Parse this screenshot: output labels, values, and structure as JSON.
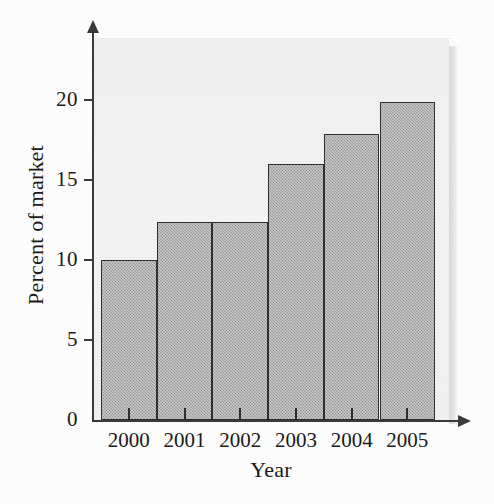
{
  "chart_data": {
    "type": "bar",
    "title": "",
    "xlabel": "Year",
    "ylabel": "Percent of market",
    "categories": [
      "2000",
      "2001",
      "2002",
      "2003",
      "2004",
      "2005"
    ],
    "values": [
      10,
      12.4,
      12.4,
      16,
      17.9,
      19.9
    ],
    "ylim": [
      0,
      23.5
    ],
    "yticks": [
      0,
      5,
      10,
      15,
      20
    ],
    "ytick_labels": [
      "0",
      "5",
      "10",
      "15",
      "20"
    ],
    "grid": false,
    "legend": null,
    "series": [
      {
        "name": "Percent of market",
        "values": [
          10,
          12.4,
          12.4,
          16,
          17.9,
          19.9
        ]
      }
    ],
    "bar_style": {
      "fill": "#9d9d9d",
      "edge": "#2e2e2e",
      "gap": 0
    },
    "colors": {
      "plot_background": "#f1f1f1",
      "axis": "#3a3a3a",
      "text": "#1a1a1a",
      "panel_shadow": "#d8d8d8"
    }
  },
  "axis": {
    "y_title": "Percent of market",
    "x_title": "Year",
    "y_tick_labels": [
      "20",
      "15",
      "10",
      "5",
      "0"
    ],
    "x_tick_labels": [
      "2000",
      "2001",
      "2002",
      "2003",
      "2004",
      "2005"
    ]
  }
}
